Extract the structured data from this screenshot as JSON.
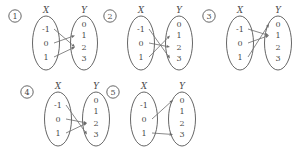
{
  "figure": {
    "title": "",
    "domain_label": "X",
    "codomain_label": "Y",
    "domain_elements": [
      "-1",
      "0",
      "1"
    ],
    "codomain_elements": [
      "0",
      "1",
      "2",
      "3"
    ],
    "line_color": "#6b6b6b",
    "oval_color": "#555555",
    "text_color": "#4a4a4a",
    "background": "#ffffff"
  },
  "diagrams": [
    {
      "tag": "1",
      "domain_label": "X",
      "codomain_label": "Y",
      "domain_elements": [
        "-1",
        "0",
        "1"
      ],
      "codomain_elements": [
        "0",
        "1",
        "2",
        "3"
      ],
      "mappings": [
        {
          "from": "-1",
          "to": "2"
        },
        {
          "from": "0",
          "to": "1"
        },
        {
          "from": "1",
          "to": "2"
        }
      ]
    },
    {
      "tag": "2",
      "domain_label": "X",
      "codomain_label": "Y",
      "domain_elements": [
        "-1",
        "0",
        "1"
      ],
      "codomain_elements": [
        "0",
        "1",
        "2",
        "3"
      ],
      "mappings": [
        {
          "from": "-1",
          "to": "3"
        },
        {
          "from": "0",
          "to": "2"
        },
        {
          "from": "1",
          "to": "1"
        }
      ]
    },
    {
      "tag": "3",
      "domain_label": "X",
      "codomain_label": "Y",
      "domain_elements": [
        "-1",
        "0",
        "1"
      ],
      "codomain_elements": [
        "0",
        "1",
        "2",
        "3"
      ],
      "mappings": [
        {
          "from": "-1",
          "to": "1"
        },
        {
          "from": "0",
          "to": "1"
        },
        {
          "from": "1",
          "to": "0"
        }
      ]
    },
    {
      "tag": "4",
      "domain_label": "X",
      "codomain_label": "Y",
      "domain_elements": [
        "-1",
        "0",
        "1"
      ],
      "codomain_elements": [
        "0",
        "1",
        "2",
        "3"
      ],
      "mappings": [
        {
          "from": "-1",
          "to": "3"
        },
        {
          "from": "0",
          "to": "2"
        },
        {
          "from": "1",
          "to": "2"
        }
      ]
    },
    {
      "tag": "5",
      "domain_label": "X",
      "codomain_label": "Y",
      "domain_elements": [
        "-1",
        "0",
        "1"
      ],
      "codomain_elements": [
        "0",
        "1",
        "2",
        "3"
      ],
      "mappings": [
        {
          "from": "0",
          "to": "0"
        },
        {
          "from": "1",
          "to": "3"
        }
      ]
    }
  ]
}
